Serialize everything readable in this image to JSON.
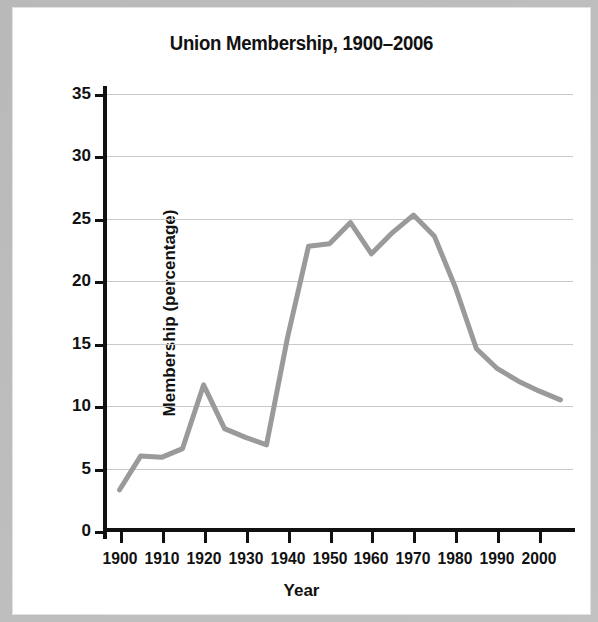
{
  "figure": {
    "title": "Union Membership, 1900–2006",
    "background": "#ffffff",
    "frame_color": "#bdbdbd"
  },
  "axes": {
    "x_title": "Year",
    "y_title": "Membership (percentage)",
    "x_tick_labels": [
      "1900",
      "1910",
      "1920",
      "1930",
      "1940",
      "1950",
      "1960",
      "1970",
      "1980",
      "1990",
      "2000"
    ],
    "y_tick_labels": [
      "0",
      "5",
      "10",
      "15",
      "20",
      "25",
      "30",
      "35"
    ]
  },
  "chart_data": {
    "type": "line",
    "title": "Union Membership, 1900–2006",
    "xlabel": "Year",
    "ylabel": "Membership (percentage)",
    "xlim": [
      1897,
      2008
    ],
    "ylim": [
      0,
      35
    ],
    "xticks": [
      1900,
      1910,
      1920,
      1930,
      1940,
      1950,
      1960,
      1970,
      1980,
      1990,
      2000
    ],
    "yticks": [
      0,
      5,
      10,
      15,
      20,
      25,
      30,
      35
    ],
    "grid": "horizontal",
    "legend": "none",
    "line_color": "#9a9a9a",
    "line_width": 5,
    "series": [
      {
        "name": "Union membership",
        "x": [
          1900,
          1905,
          1910,
          1915,
          1920,
          1925,
          1930,
          1935,
          1940,
          1945,
          1950,
          1955,
          1960,
          1965,
          1970,
          1975,
          1980,
          1985,
          1990,
          1995,
          2000,
          2005
        ],
        "values": [
          3.3,
          6.0,
          5.9,
          6.6,
          11.7,
          8.2,
          7.5,
          6.9,
          15.5,
          22.8,
          23.0,
          24.7,
          22.2,
          23.9,
          25.3,
          23.6,
          19.5,
          14.6,
          13.0,
          12.0,
          11.2,
          10.5
        ]
      }
    ]
  }
}
